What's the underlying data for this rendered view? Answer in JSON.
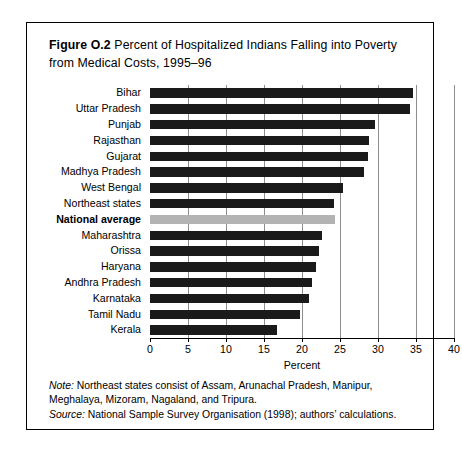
{
  "figure": {
    "label": "Figure O.2",
    "title": "Percent of Hospitalized Indians Falling into Poverty from Medical Costs, 1995–96",
    "note_label": "Note:",
    "note_text": " Northeast states consist of Assam, Arunachal Pradesh, Manipur, Meghalaya, Mizoram, Nagaland, and Tripura.",
    "source_label": "Source:",
    "source_text": " National Sample Survey Organisation (1998); authors’ calculations."
  },
  "colors": {
    "bar": "#1a1a1a",
    "highlight_bar": "#b3b3b3",
    "gridline": "#8d8d8d",
    "border": "#000000",
    "background": "#ffffff"
  },
  "chart_data": {
    "type": "bar",
    "orientation": "horizontal",
    "title": "Figure O.2 Percent of Hospitalized Indians Falling into Poverty from Medical Costs, 1995–96",
    "xlabel": "Percent",
    "ylabel": "",
    "xlim": [
      0,
      40
    ],
    "xticks": [
      0,
      5,
      10,
      15,
      20,
      25,
      30,
      35,
      40
    ],
    "xtick_labels": [
      "0",
      "5",
      "10",
      "15",
      "20",
      "25",
      "30",
      "35",
      "40"
    ],
    "grid": true,
    "legend": false,
    "categories": [
      "Bihar",
      "Uttar Pradesh",
      "Punjab",
      "Rajasthan",
      "Gujarat",
      "Madhya Pradesh",
      "West Bengal",
      "Northeast states",
      "National average",
      "Maharashtra",
      "Orissa",
      "Haryana",
      "Andhra Pradesh",
      "Karnataka",
      "Tamil Nadu",
      "Kerala"
    ],
    "values": [
      34.6,
      34.2,
      29.6,
      28.8,
      28.7,
      28.2,
      25.4,
      24.2,
      24.3,
      22.6,
      22.2,
      21.8,
      21.3,
      20.9,
      19.7,
      16.7
    ],
    "highlight_category": "National average"
  }
}
